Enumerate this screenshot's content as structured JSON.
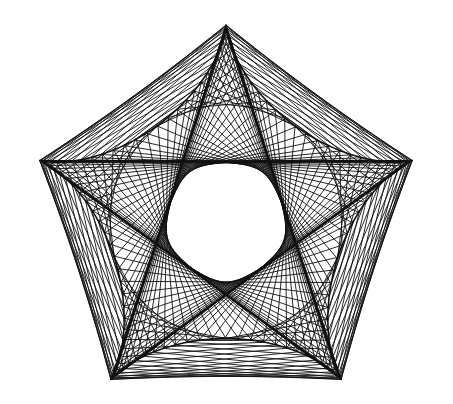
{
  "figure": {
    "background": "#ffffff",
    "stroke_color": "#111111",
    "width": 453,
    "height": 404,
    "center": [
      226,
      221
    ],
    "cusp_radius": 196,
    "cusps": 5,
    "rotation_deg": -90,
    "tips": [
      {
        "name": "top",
        "x": 226,
        "y": 24
      },
      {
        "name": "right",
        "x": 416,
        "y": 163
      },
      {
        "name": "bottom-right",
        "x": 346,
        "y": 381
      },
      {
        "name": "bottom-left",
        "x": 108,
        "y": 381
      },
      {
        "name": "left",
        "x": 34,
        "y": 163
      }
    ],
    "chord_families": [
      {
        "samples": 150,
        "delta": 1.05
      },
      {
        "samples": 150,
        "delta": 2.35
      }
    ]
  }
}
